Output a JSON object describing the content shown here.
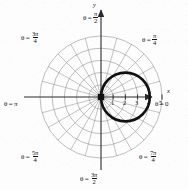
{
  "figure": {
    "type": "polar-plot",
    "axes": {
      "x_axis_name": "x",
      "y_axis_name": "y",
      "origin_px": [
        101,
        97
      ],
      "unit_px": 12.2,
      "x_ticks": [
        "1",
        "2",
        "3",
        "4",
        "5"
      ],
      "x_tick_values": [
        1,
        2,
        3,
        4,
        5
      ]
    },
    "angle_labels": [
      {
        "id": "theta-0",
        "text_theta": "θ = 0",
        "has_fraction": false,
        "whole": "0",
        "deg": 0,
        "x": 155,
        "y": 101
      },
      {
        "id": "theta-pi-4",
        "text_theta": "θ =",
        "has_fraction": true,
        "num": "π",
        "den": "4",
        "deg": 45,
        "x": 142,
        "y": 33
      },
      {
        "id": "theta-pi-2",
        "text_theta": "θ =",
        "has_fraction": true,
        "num": "π",
        "den": "2",
        "deg": 90,
        "x": 83,
        "y": 11
      },
      {
        "id": "theta-3pi-4",
        "text_theta": "θ =",
        "has_fraction": true,
        "num": "3π",
        "den": "4",
        "deg": 135,
        "x": 21,
        "y": 31
      },
      {
        "id": "theta-pi",
        "text_theta": "θ = π",
        "has_fraction": false,
        "whole": "π",
        "deg": 180,
        "x": 4,
        "y": 101
      },
      {
        "id": "theta-5pi-4",
        "text_theta": "θ =",
        "has_fraction": true,
        "num": "5π",
        "den": "4",
        "deg": 225,
        "x": 21,
        "y": 150
      },
      {
        "id": "theta-3pi-2",
        "text_theta": "θ =",
        "has_fraction": true,
        "num": "3π",
        "den": "2",
        "deg": 270,
        "x": 80,
        "y": 172
      },
      {
        "id": "theta-7pi-4",
        "text_theta": "θ =",
        "has_fraction": true,
        "num": "7π",
        "den": "4",
        "deg": 315,
        "x": 139,
        "y": 150
      }
    ],
    "grid": {
      "circle_radii_units": [
        1,
        2,
        3,
        4,
        5
      ],
      "spoke_step_deg": 15,
      "spoke_count": 24,
      "grid_color": "#9a9a9a",
      "axis_color": "#2a2a2a"
    },
    "curve": {
      "name": "circle",
      "description": "circle through the pole reaching r = 4 at theta = 0",
      "center_units": [
        2,
        0
      ],
      "radius_units": 2,
      "color": "#111111",
      "stroke_px": 2.6
    },
    "origin_marker": {
      "name": "pole-dot",
      "color": "#111111"
    }
  },
  "colors": {
    "background": "#fdfdfd",
    "ink": "#141414",
    "grid": "#9a9a9a",
    "curve": "#111111"
  }
}
